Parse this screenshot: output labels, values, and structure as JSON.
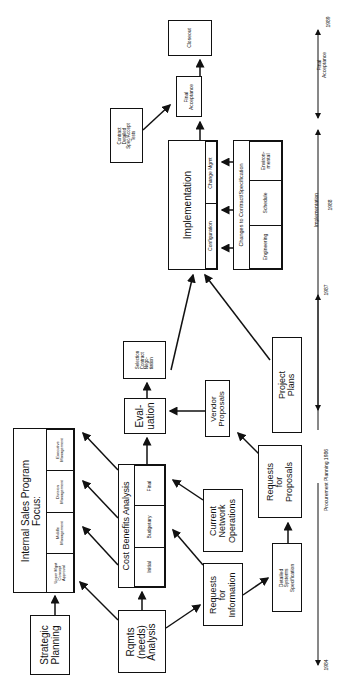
{
  "nodes": {
    "strategic_planning": "Strategic\nPlanning",
    "internal_sales": {
      "title": "Internal Sales Program\nFocus:",
      "cells": [
        "Upper Mgnt\nConcept\nApproval",
        "Middle\nManagement",
        "Division\nManagement",
        "Executive\nManagement"
      ]
    },
    "rqmts": "Rqmts\n(needs)\nAnalysis",
    "cost_benefits": {
      "title": "Cost Benefits Analysis",
      "cells": [
        "Initial",
        "Budgetary",
        "Final"
      ]
    },
    "rfi": "Requests\nfor\nInformation",
    "detailed_spec": "Detailed\nSystems\nSpecification",
    "current_network": "Current\nNetwork\nOperations",
    "rfp": "Requests\nfor\nProposals",
    "evaluation": "Eval-\nuation",
    "selection": "Selection\nContract\nNego-\ntiation",
    "vendor_proposals": "Vendor\nProposals",
    "project_plans": "Project\nPlans",
    "implementation": {
      "title": "Implementation",
      "cells": [
        "Configuration",
        "Change Mgmt"
      ]
    },
    "changes": {
      "title": "Changes to Contract/Specification",
      "cells": [
        "Engineering",
        "Schedule",
        "Environ-\nmental"
      ]
    },
    "contract_detailed": "Contract\nDetailed\nSpec/Accept\nTests",
    "final_acceptance": "Final\nAcceptance",
    "closeout": "Closeout"
  },
  "timeline": {
    "years": [
      "1984",
      "1987",
      "1988",
      "1989"
    ],
    "phases": [
      "Procurement  Planning 1986",
      "Implementation",
      "Final\nAcceptance"
    ]
  }
}
